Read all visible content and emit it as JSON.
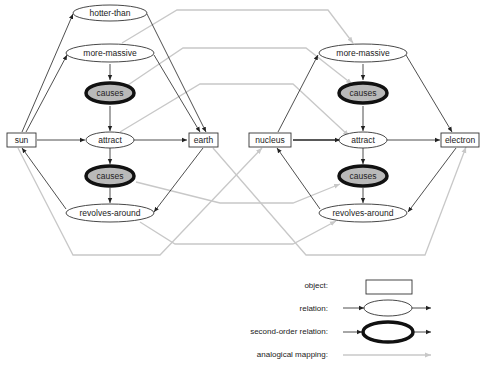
{
  "diagram": {
    "left": {
      "objects": {
        "subject": "sun",
        "target": "earth"
      },
      "relations": {
        "hotter": "hotter-than",
        "massive": "more-massive",
        "attract": "attract",
        "revolves": "revolves-around"
      },
      "second_order": {
        "upper": "causes",
        "lower": "causes"
      }
    },
    "right": {
      "objects": {
        "subject": "nucleus",
        "target": "electron"
      },
      "relations": {
        "massive": "more-massive",
        "attract": "attract",
        "revolves": "revolves-around"
      },
      "second_order": {
        "upper": "causes",
        "lower": "causes"
      }
    }
  },
  "legend": {
    "object": "object:",
    "relation": "relation:",
    "second_order": "second-order relation:",
    "mapping": "analogical mapping:"
  },
  "colors": {
    "edge": "#222222",
    "mapping": "#c8c8c8",
    "second_order_fill": "#b9b9b9"
  }
}
